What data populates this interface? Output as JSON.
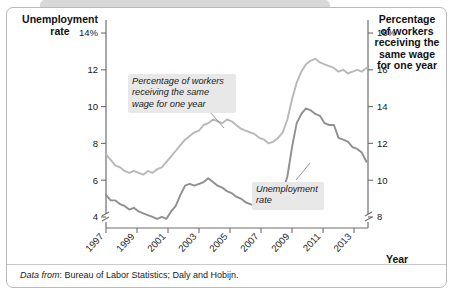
{
  "left_axis": {
    "title": "Unemployment\nrate",
    "title_line1": "Unemployment",
    "title_line2": "rate",
    "ticks": [
      "14%",
      "12",
      "10",
      "8",
      "6",
      "4"
    ],
    "values": [
      14,
      12,
      10,
      8,
      6,
      4
    ],
    "has_break": true
  },
  "right_axis": {
    "title_line1": "Percentage",
    "title_line2": "of workers",
    "title_line3": "receiving the",
    "title_line4": "same wage",
    "title_line5": "for one year",
    "ticks": [
      "18%",
      "16",
      "14",
      "12",
      "10",
      "8"
    ],
    "values": [
      18,
      16,
      14,
      12,
      10,
      8
    ],
    "has_break": true
  },
  "x_axis": {
    "title": "Year",
    "ticks": [
      "1997",
      "1999",
      "2001",
      "2003",
      "2005",
      "2007",
      "2009",
      "2011",
      "2013"
    ]
  },
  "callouts": {
    "wage_line1": "Percentage of workers",
    "wage_line2": "receiving the same",
    "wage_line3": "wage for one year",
    "unemp_line1": "Unemployment",
    "unemp_line2": "rate"
  },
  "source": {
    "label": "Data from",
    "text": ": Bureau of Labor Statistics; Daly and Hobijn."
  },
  "colors": {
    "unemployment_line": "#8f8f8f",
    "wage_line": "#b8b8b8",
    "axis": "#6e6e6e",
    "callout_bg": "#e8e8e8",
    "card_border": "#b9b9b9",
    "tab": "#d8d8d8"
  },
  "chart_data": {
    "type": "line",
    "title": "",
    "xlabel": "Year",
    "ylabel": "Unemployment rate",
    "y2label": "Percentage of workers receiving the same wage for one year",
    "xlim": [
      1997,
      2013.9
    ],
    "ylim": [
      3.4,
      14.6
    ],
    "y2lim": [
      7.4,
      18.6
    ],
    "grid": false,
    "legend": "annotations",
    "x_ticks": [
      1997,
      1999,
      2001,
      2003,
      2005,
      2007,
      2009,
      2011,
      2013
    ],
    "y_ticks": [
      4,
      6,
      8,
      10,
      12,
      14
    ],
    "y2_ticks": [
      8,
      10,
      12,
      14,
      16,
      18
    ],
    "series": [
      {
        "name": "Unemployment rate",
        "axis": "left",
        "color": "#8f8f8f",
        "x": [
          1997.0,
          1997.3,
          1997.6,
          1997.9,
          1998.2,
          1998.5,
          1998.8,
          1999.1,
          1999.4,
          1999.7,
          2000.0,
          2000.3,
          2000.6,
          2000.9,
          2001.2,
          2001.5,
          2001.8,
          2002.1,
          2002.4,
          2002.7,
          2003.0,
          2003.3,
          2003.6,
          2003.9,
          2004.2,
          2004.5,
          2004.8,
          2005.1,
          2005.4,
          2005.7,
          2006.0,
          2006.3,
          2006.6,
          2006.9,
          2007.2,
          2007.5,
          2007.8,
          2008.1,
          2008.4,
          2008.7,
          2009.0,
          2009.3,
          2009.6,
          2009.9,
          2010.2,
          2010.5,
          2010.8,
          2011.1,
          2011.4,
          2011.7,
          2012.0,
          2012.3,
          2012.6,
          2012.9,
          2013.2,
          2013.5,
          2013.8
        ],
        "y": [
          5.2,
          4.9,
          4.9,
          4.7,
          4.6,
          4.4,
          4.5,
          4.3,
          4.2,
          4.1,
          4.0,
          3.9,
          4.0,
          3.9,
          4.3,
          4.6,
          5.2,
          5.7,
          5.8,
          5.7,
          5.8,
          5.9,
          6.1,
          5.9,
          5.7,
          5.6,
          5.4,
          5.3,
          5.1,
          5.0,
          4.8,
          4.7,
          4.6,
          4.5,
          4.5,
          4.6,
          4.7,
          5.0,
          5.4,
          6.2,
          7.8,
          9.1,
          9.6,
          9.9,
          9.8,
          9.6,
          9.5,
          9.1,
          9.0,
          9.0,
          8.3,
          8.2,
          8.1,
          7.8,
          7.7,
          7.5,
          7.0
        ]
      },
      {
        "name": "Percentage of workers receiving the same wage for one year",
        "axis": "right",
        "color": "#b8b8b8",
        "x": [
          1997.0,
          1997.3,
          1997.6,
          1997.9,
          1998.2,
          1998.5,
          1998.8,
          1999.1,
          1999.4,
          1999.7,
          2000.0,
          2000.3,
          2000.6,
          2000.9,
          2001.2,
          2001.5,
          2001.8,
          2002.1,
          2002.4,
          2002.7,
          2003.0,
          2003.3,
          2003.6,
          2003.9,
          2004.2,
          2004.5,
          2004.8,
          2005.1,
          2005.4,
          2005.7,
          2006.0,
          2006.3,
          2006.6,
          2006.9,
          2007.2,
          2007.5,
          2007.8,
          2008.1,
          2008.4,
          2008.7,
          2009.0,
          2009.3,
          2009.6,
          2009.9,
          2010.2,
          2010.5,
          2010.8,
          2011.1,
          2011.4,
          2011.7,
          2012.0,
          2012.3,
          2012.6,
          2012.9,
          2013.2,
          2013.5,
          2013.8
        ],
        "y": [
          11.4,
          11.1,
          10.8,
          10.7,
          10.5,
          10.4,
          10.5,
          10.4,
          10.3,
          10.5,
          10.4,
          10.6,
          10.7,
          11.0,
          11.3,
          11.6,
          11.9,
          12.2,
          12.4,
          12.6,
          12.7,
          13.0,
          13.1,
          13.3,
          13.2,
          13.1,
          13.3,
          13.2,
          13.0,
          12.8,
          12.7,
          12.6,
          12.5,
          12.3,
          12.2,
          12.0,
          12.1,
          12.3,
          12.6,
          13.3,
          14.4,
          15.3,
          15.9,
          16.3,
          16.5,
          16.6,
          16.4,
          16.3,
          16.2,
          16.1,
          15.9,
          16.0,
          15.8,
          15.9,
          16.0,
          15.9,
          16.1
        ]
      }
    ]
  }
}
